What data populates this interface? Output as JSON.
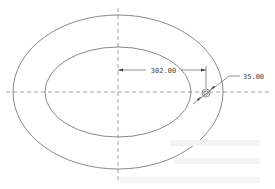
{
  "drawing": {
    "center": {
      "x": 118,
      "y": 92
    },
    "outer_ellipse": {
      "rx": 105,
      "ry": 77
    },
    "inner_ellipse": {
      "rx": 73,
      "ry": 45
    },
    "hole": {
      "cx": 206,
      "cy": 93,
      "r": 4
    },
    "line_color": "#555555",
    "dims": {
      "distance": "302.00",
      "diameter": "35.00"
    }
  }
}
